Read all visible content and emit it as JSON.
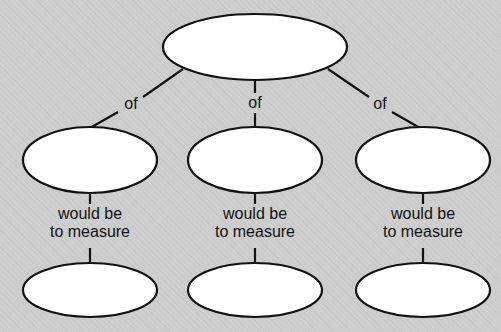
{
  "diagram": {
    "type": "concept-map",
    "background_color": "#cdcdcd",
    "node_fill": "#ffffff",
    "stroke_color": "#111111",
    "root": {
      "label": ""
    },
    "branches": [
      {
        "edge_label": "of",
        "node_label": "",
        "sub_edge_label_line1": "would be",
        "sub_edge_label_line2": "to measure",
        "leaf_label": ""
      },
      {
        "edge_label": "of",
        "node_label": "",
        "sub_edge_label_line1": "would be",
        "sub_edge_label_line2": "to measure",
        "leaf_label": ""
      },
      {
        "edge_label": "of",
        "node_label": "",
        "sub_edge_label_line1": "would be",
        "sub_edge_label_line2": "to measure",
        "leaf_label": ""
      }
    ]
  }
}
